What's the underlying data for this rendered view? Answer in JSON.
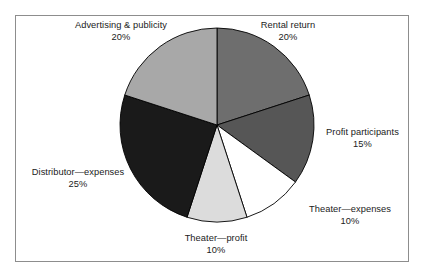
{
  "chart_data": {
    "type": "pie",
    "title": "",
    "subtitle": "",
    "xlabel": "",
    "ylabel": "",
    "legend_position": "none",
    "grid": false,
    "labels_inline": true,
    "start_angle_deg": 0,
    "direction": "clockwise",
    "categories": [
      "Rental return",
      "Profit participants",
      "Theater—expenses",
      "Theater—profit",
      "Distributor—expenses",
      "Advertising & publicity"
    ],
    "values": [
      20,
      15,
      10,
      10,
      25,
      20
    ],
    "value_labels": [
      "20%",
      "15%",
      "10%",
      "10%",
      "25%",
      "20%"
    ],
    "colors": [
      "#6e6e6e",
      "#565656",
      "#ffffff",
      "#dcdcdc",
      "#1a1a1a",
      "#a8a8a8"
    ],
    "slices": [
      {
        "label": "Rental return",
        "value": 20,
        "value_label": "20%",
        "color": "#6e6e6e"
      },
      {
        "label": "Profit participants",
        "value": 15,
        "value_label": "15%",
        "color": "#565656"
      },
      {
        "label": "Theater—expenses",
        "value": 10,
        "value_label": "10%",
        "color": "#ffffff"
      },
      {
        "label": "Theater—profit",
        "value": 10,
        "value_label": "10%",
        "color": "#dcdcdc"
      },
      {
        "label": "Distributor—expenses",
        "value": 25,
        "value_label": "25%",
        "color": "#1a1a1a"
      },
      {
        "label": "Advertising & publicity",
        "value": 20,
        "value_label": "20%",
        "color": "#a8a8a8"
      }
    ]
  },
  "style": {
    "frame_color": "#8d8d8d",
    "background": "#ffffff",
    "slice_outline": "#000000",
    "text_color": "#1b1b1b"
  }
}
